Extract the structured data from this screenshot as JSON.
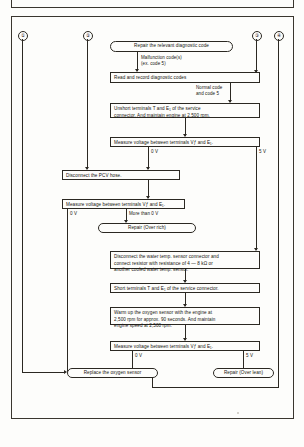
{
  "connectors": {
    "c1": "①",
    "c2": "②",
    "c3": "③",
    "c4": "④"
  },
  "nodes": {
    "repair_relevant": "Repair the relevant diagnostic code",
    "read_record": "Read and record diagnostic codes",
    "unshort": "Unshort terminals T and E₁ of the service\nconnector. And maintain engine at 2,500 rpm.",
    "measure1": "Measure voltage between terminals Vƒ and E₁.",
    "disconnect_pcv": "Disconnect the PCV hose.",
    "measure2": "Measure voltage between terminals Vƒ and E₁.",
    "repair_over_rich": "Repair (Over rich)",
    "disconnect_wts": "Disconnect the water temp. sensor connector and\nconnect resistor with resistance of 4 — 8 kΩ or\nanother cooled water temp. sensor.",
    "short_terminals": "Short terminals T and E₁ of the service connector.",
    "warm_up": "Warm up the oxygen sensor with the engine at\n2,500 rpm for approx. 90 seconds. And maintain\nengine speed at 2,500 rpm.",
    "measure3": "Measure voltage between terminals Vƒ and E₁.",
    "replace_sensor": "Replace the oxygen sensor",
    "repair_over_lean": "Repair (Over lean)"
  },
  "edge_labels": {
    "malfunction": "Malfunction code(s)\n(ex. code 5)",
    "normal": "Normal code\nand code 5",
    "m1_left": "0 V",
    "m1_right": "5 V",
    "m2_left": "0 V",
    "m2_right": "More than 0 V",
    "m3_left": "0 V",
    "m3_right": "5 V"
  },
  "colors": {
    "ink": "#2b2822",
    "paper": "#fdfdfb"
  }
}
